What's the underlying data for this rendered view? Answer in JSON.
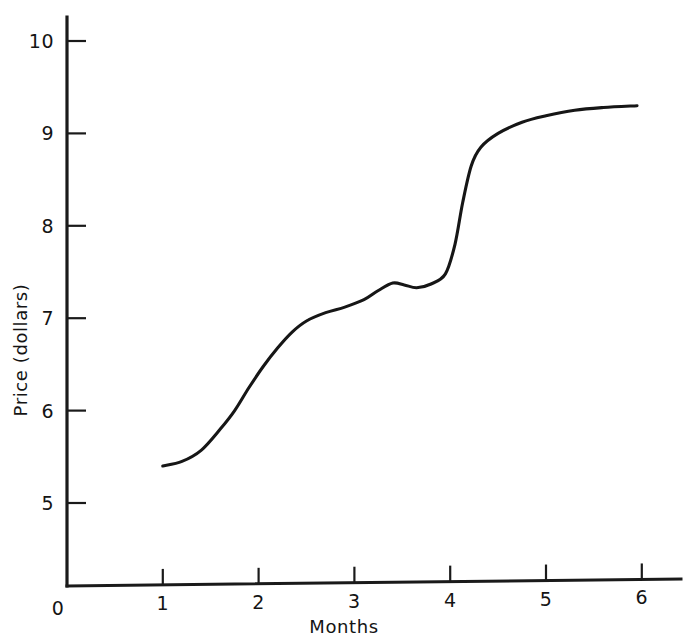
{
  "chart_data": {
    "type": "line",
    "title": "",
    "xlabel": "Months",
    "ylabel": "Price (dollars)",
    "xlim": [
      0,
      6.4
    ],
    "ylim": [
      0,
      10.3
    ],
    "grid": false,
    "legend": null,
    "x_ticks": [
      0,
      1,
      2,
      3,
      4,
      5,
      6
    ],
    "x_tick_labels": [
      "0",
      "1",
      "2",
      "3",
      "4",
      "5",
      "6"
    ],
    "y_ticks": [
      5,
      6,
      7,
      8,
      9,
      10
    ],
    "y_tick_labels": [
      "5",
      "6",
      "7",
      "8",
      "9",
      "10"
    ],
    "y_axis_origin_label": "0",
    "series": [
      {
        "name": "Price",
        "color": "#161616",
        "x": [
          1.0,
          1.2,
          1.4,
          1.6,
          1.75,
          1.9,
          2.05,
          2.2,
          2.35,
          2.5,
          2.7,
          2.9,
          3.1,
          3.25,
          3.4,
          3.52,
          3.65,
          3.8,
          3.95,
          4.05,
          4.13,
          4.22,
          4.32,
          4.5,
          4.75,
          5.0,
          5.3,
          5.6,
          5.95
        ],
        "y": [
          5.4,
          5.45,
          5.57,
          5.8,
          6.0,
          6.25,
          6.48,
          6.68,
          6.85,
          6.97,
          7.06,
          7.12,
          7.2,
          7.3,
          7.38,
          7.36,
          7.33,
          7.37,
          7.48,
          7.8,
          8.25,
          8.65,
          8.85,
          9.0,
          9.12,
          9.19,
          9.25,
          9.28,
          9.3
        ]
      }
    ]
  },
  "axes": {
    "x_label": "Months",
    "y_label": "Price (dollars)"
  }
}
